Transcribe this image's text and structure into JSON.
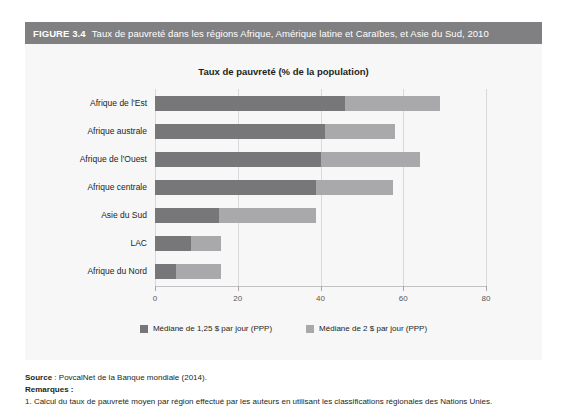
{
  "figure": {
    "number": "FIGURE 3.4",
    "title": "Taux de pauvreté dans les régions Afrique, Amérique latine et Caraïbes, et Asie du Sud, 2010",
    "header_color": "#808083",
    "panel_color": "#f7f7f8"
  },
  "chart_data": {
    "type": "bar",
    "orientation": "horizontal",
    "stacked": true,
    "title": "Taux de pauvreté (% de la population)",
    "xlabel": "",
    "ylabel": "",
    "xlim": [
      0,
      80
    ],
    "xticks": [
      0,
      20,
      40,
      60,
      80
    ],
    "xtick_labels": [
      "0",
      "20",
      "40",
      "60",
      "80"
    ],
    "grid": true,
    "legend_position": "bottom",
    "categories": [
      "Afrique de l'Est",
      "Afrique australe",
      "Afrique de l'Ouest",
      "Afrique centrale",
      "Asie du Sud",
      "LAC",
      "Afrique du Nord"
    ],
    "series": [
      {
        "name": "Médiane de 1,25 $ par jour (PPP)",
        "color": "#777779",
        "values": [
          46.0,
          41.0,
          40.0,
          39.0,
          15.5,
          8.7,
          5.0
        ]
      },
      {
        "name": "Médiane de 2 $ par jour (PPP)",
        "color": "#a9a9ab",
        "values": [
          23.0,
          17.0,
          24.0,
          18.5,
          23.5,
          7.3,
          11.0
        ]
      }
    ],
    "totals": [
      69.0,
      58.0,
      64.0,
      57.5,
      39.0,
      16.0,
      16.0
    ]
  },
  "footer": {
    "source_label": "Source",
    "source_text": " : PovcalNet de la Banque mondiale (2014).",
    "notes_label": "Remarques :",
    "notes": [
      "1.  Calcul du taux de pauvreté moyen par région effectué par les auteurs en utilisant les classifications régionales des Nations Unies."
    ]
  }
}
